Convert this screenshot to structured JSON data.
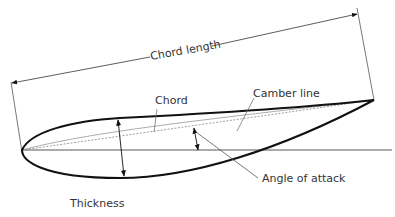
{
  "diagram": {
    "labels": {
      "chord_length": "Chord length",
      "chord": "Chord",
      "camber_line": "Camber line",
      "angle_of_attack": "Angle of attack",
      "thickness": "Thickness"
    },
    "colors": {
      "outline": "#111111",
      "thin_line": "#444444",
      "dashed_line": "#777777",
      "text": "#333333",
      "background": "#ffffff"
    }
  }
}
